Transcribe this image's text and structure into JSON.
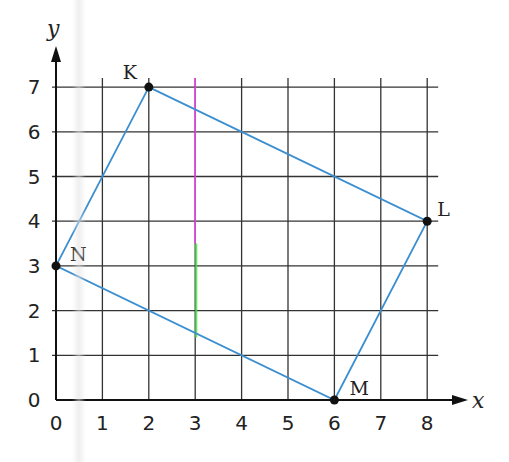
{
  "chart_data": {
    "type": "scatter",
    "title": "",
    "xlabel": "x",
    "ylabel": "y",
    "xlim": [
      0,
      8
    ],
    "ylim": [
      0,
      7
    ],
    "grid": true,
    "x_ticks": [
      "0",
      "1",
      "2",
      "3",
      "4",
      "5",
      "6",
      "7",
      "8"
    ],
    "y_ticks": [
      "0",
      "1",
      "2",
      "3",
      "4",
      "5",
      "6",
      "7"
    ],
    "points": [
      {
        "label": "K",
        "x": 2,
        "y": 7
      },
      {
        "label": "L",
        "x": 8,
        "y": 4
      },
      {
        "label": "M",
        "x": 6,
        "y": 0
      },
      {
        "label": "N",
        "x": 0,
        "y": 3
      }
    ],
    "polygon": [
      "K",
      "L",
      "M",
      "N"
    ],
    "annotations": [
      {
        "type": "highlighted-gridline",
        "x": 3,
        "color_top": "#e040e0",
        "color_bottom": "#40e040"
      }
    ],
    "colors": {
      "polygon_edge": "#3b8fd0",
      "grid": "#333333",
      "point": "#111111"
    }
  }
}
